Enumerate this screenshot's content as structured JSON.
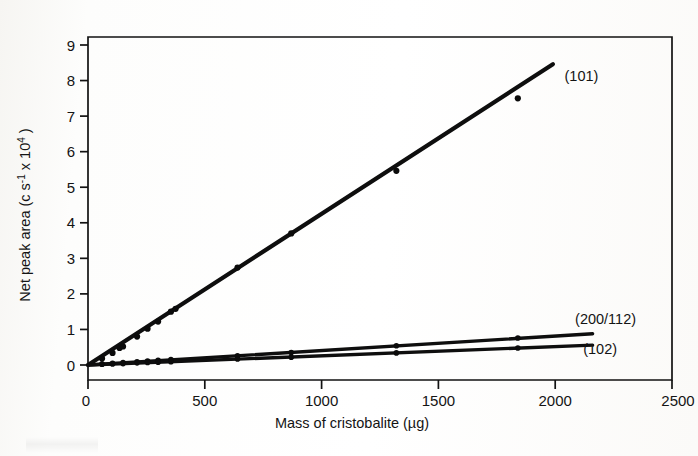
{
  "figure": {
    "kind": "scientific-line-plot",
    "background_color": "#fdfdfb",
    "ink_color": "#0e0e0e"
  },
  "chart_data": {
    "type": "line",
    "title": "",
    "subtitle": "",
    "xlabel": "Mass of cristobalite  (µg)",
    "ylabel": "Net peak area (c s⁻¹ x 10⁴ )",
    "ylabel_parts": {
      "prefix": "Net peak area (c s",
      "sup1": "-1",
      "mid": " x 10",
      "sup2": "4",
      "suffix": " )"
    },
    "xlim": [
      0,
      2500
    ],
    "ylim": [
      0,
      9
    ],
    "xticks": [
      0,
      500,
      1000,
      1500,
      2000,
      2500
    ],
    "xticklabels": [
      "0",
      "500",
      "1000",
      "1500",
      "2000",
      "2500"
    ],
    "yticks": [
      0,
      1,
      2,
      3,
      4,
      5,
      6,
      7,
      8,
      9
    ],
    "yticklabels": [
      "0",
      "1",
      "2",
      "3",
      "4",
      "5",
      "6",
      "7",
      "8",
      "9"
    ],
    "grid": false,
    "legend_position": "inline-right-of-line-ends",
    "frame": "box",
    "series": [
      {
        "name": "(101)",
        "label": "(101)",
        "label_x": 2040,
        "label_y": 8.12,
        "slope_per_ug": 0.00425,
        "line_from": [
          0,
          0
        ],
        "line_to": [
          1990,
          8.46
        ],
        "points_x": [
          60,
          105,
          135,
          150,
          210,
          255,
          300,
          355,
          375,
          640,
          870,
          1320,
          1840
        ],
        "points_y": [
          0.18,
          0.34,
          0.48,
          0.52,
          0.8,
          1.02,
          1.22,
          1.5,
          1.58,
          2.74,
          3.7,
          5.46,
          7.5
        ]
      },
      {
        "name": "(200/112)",
        "label": "(200/112)",
        "label_x": 2085,
        "label_y": 1.3,
        "slope_per_ug": 0.00041,
        "line_from": [
          0,
          0
        ],
        "line_to": [
          2160,
          0.88
        ],
        "points_x": [
          60,
          105,
          150,
          210,
          255,
          300,
          355,
          640,
          870,
          1320,
          1840
        ],
        "points_y": [
          0.03,
          0.05,
          0.07,
          0.09,
          0.11,
          0.13,
          0.15,
          0.26,
          0.35,
          0.54,
          0.76
        ]
      },
      {
        "name": "(102)",
        "label": "(102)",
        "label_x": 2120,
        "label_y": 0.44,
        "slope_per_ug": 0.00026,
        "line_from": [
          0,
          0
        ],
        "line_to": [
          2160,
          0.56
        ],
        "points_x": [
          60,
          105,
          150,
          210,
          255,
          300,
          355,
          640,
          870,
          1320,
          1840
        ],
        "points_y": [
          0.02,
          0.03,
          0.04,
          0.06,
          0.07,
          0.08,
          0.09,
          0.17,
          0.22,
          0.34,
          0.48
        ]
      }
    ]
  }
}
